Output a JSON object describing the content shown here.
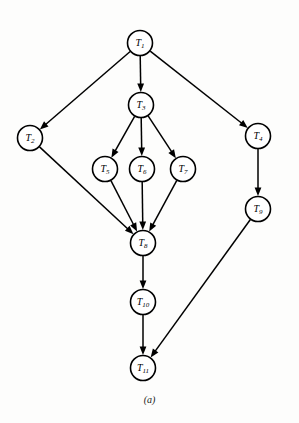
{
  "figure": {
    "caption": "(a)",
    "caption_x": 148,
    "caption_y": 394,
    "background_color": "#fdfdfc",
    "stroke_color": "#000000"
  },
  "graph": {
    "type": "directed-acyclic-graph",
    "node_radius": 12.5,
    "nodes": [
      {
        "id": "T1",
        "base": "T",
        "sub": "1",
        "label": "T1",
        "x": 140,
        "y": 43
      },
      {
        "id": "T2",
        "base": "T",
        "sub": "2",
        "label": "T2",
        "x": 30,
        "y": 138
      },
      {
        "id": "T3",
        "base": "T",
        "sub": "3",
        "label": "T3",
        "x": 141,
        "y": 105
      },
      {
        "id": "T4",
        "base": "T",
        "sub": "4",
        "label": "T4",
        "x": 258,
        "y": 136
      },
      {
        "id": "T5",
        "base": "T",
        "sub": "5",
        "label": "T5",
        "x": 105,
        "y": 169
      },
      {
        "id": "T6",
        "base": "T",
        "sub": "6",
        "label": "T6",
        "x": 142,
        "y": 169
      },
      {
        "id": "T7",
        "base": "T",
        "sub": "7",
        "label": "T7",
        "x": 183,
        "y": 169
      },
      {
        "id": "T8",
        "base": "T",
        "sub": "8",
        "label": "T8",
        "x": 143,
        "y": 243
      },
      {
        "id": "T9",
        "base": "T",
        "sub": "9",
        "label": "T9",
        "x": 258,
        "y": 209
      },
      {
        "id": "T10",
        "base": "T",
        "sub": "10",
        "label": "T10",
        "x": 143,
        "y": 302
      },
      {
        "id": "T11",
        "base": "T",
        "sub": "11",
        "label": "T11",
        "x": 143,
        "y": 368
      }
    ],
    "edges": [
      {
        "from": "T1",
        "to": "T2"
      },
      {
        "from": "T1",
        "to": "T3"
      },
      {
        "from": "T1",
        "to": "T4"
      },
      {
        "from": "T3",
        "to": "T5"
      },
      {
        "from": "T3",
        "to": "T6"
      },
      {
        "from": "T3",
        "to": "T7"
      },
      {
        "from": "T2",
        "to": "T8"
      },
      {
        "from": "T5",
        "to": "T8"
      },
      {
        "from": "T6",
        "to": "T8"
      },
      {
        "from": "T7",
        "to": "T8"
      },
      {
        "from": "T4",
        "to": "T9"
      },
      {
        "from": "T8",
        "to": "T10"
      },
      {
        "from": "T10",
        "to": "T11"
      },
      {
        "from": "T9",
        "to": "T11"
      }
    ]
  }
}
